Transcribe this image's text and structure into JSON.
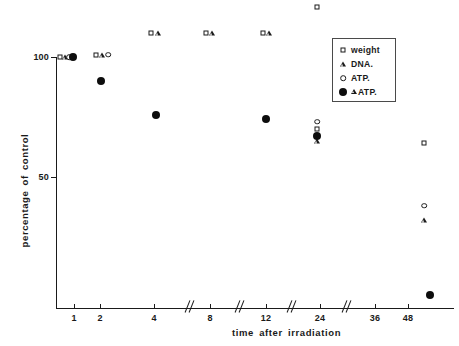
{
  "chart_data": {
    "type": "scatter",
    "title": "",
    "xlabel": "time  after  irradiation",
    "ylabel": "percentage of control",
    "xtick_labels": [
      "1",
      "2",
      "4",
      "8",
      "12",
      "24",
      "36",
      "48"
    ],
    "xtick_px": [
      74,
      100,
      154,
      210,
      266,
      320,
      375,
      408
    ],
    "axis_breaks_px": [
      190,
      240,
      292,
      347
    ],
    "ytick_labels": [
      "100",
      "50"
    ],
    "ytick_values": [
      100,
      50
    ],
    "ylim": [
      0,
      125
    ],
    "grid": false,
    "legend_position": "top-right",
    "series": [
      {
        "name": "weight",
        "marker": "square-open",
        "points": [
          {
            "x_label": "1",
            "x_px": 60,
            "y": 100
          },
          {
            "x_label": "2",
            "x_px": 96,
            "y": 101
          },
          {
            "x_label": "4",
            "x_px": 151,
            "y": 110
          },
          {
            "x_label": "8",
            "x_px": 206,
            "y": 110
          },
          {
            "x_label": "12",
            "x_px": 263,
            "y": 110
          },
          {
            "x_label": "24",
            "x_px": 317,
            "y": 121
          },
          {
            "x_label": "24",
            "x_px": 317,
            "y": 70
          },
          {
            "x_label": "48",
            "x_px": 424,
            "y": 64
          }
        ]
      },
      {
        "name": "DNA.",
        "marker": "triangle-open",
        "points": [
          {
            "x_label": "1",
            "x_px": 65,
            "y": 100
          },
          {
            "x_label": "2",
            "x_px": 102,
            "y": 101
          },
          {
            "x_label": "4",
            "x_px": 158,
            "y": 110
          },
          {
            "x_label": "8",
            "x_px": 212,
            "y": 110
          },
          {
            "x_label": "12",
            "x_px": 269,
            "y": 110
          },
          {
            "x_label": "24",
            "x_px": 317,
            "y": 65
          },
          {
            "x_label": "48",
            "x_px": 424,
            "y": 32
          }
        ]
      },
      {
        "name": "ATP.",
        "marker": "circle-open",
        "points": [
          {
            "x_label": "1",
            "x_px": 69,
            "y": 100
          },
          {
            "x_label": "2",
            "x_px": 108,
            "y": 101
          },
          {
            "x_label": "24",
            "x_px": 317,
            "y": 73
          },
          {
            "x_label": "48",
            "x_px": 424,
            "y": 38
          }
        ]
      },
      {
        "name": "△ATP.",
        "marker": "circle-filled",
        "points": [
          {
            "x_label": "1",
            "x_px": 73,
            "y": 100
          },
          {
            "x_label": "2",
            "x_px": 101,
            "y": 90
          },
          {
            "x_label": "4",
            "x_px": 156,
            "y": 76
          },
          {
            "x_label": "12",
            "x_px": 266,
            "y": 74
          },
          {
            "x_label": "24",
            "x_px": 317,
            "y": 67
          },
          {
            "x_label": "48",
            "x_px": 430,
            "y": 1
          }
        ]
      }
    ]
  },
  "legend": {
    "items": [
      {
        "label": "weight",
        "marker": "square-open",
        "prefix_triangle": false
      },
      {
        "label": "DNA.",
        "marker": "triangle-open",
        "prefix_triangle": false
      },
      {
        "label": "ATP.",
        "marker": "circle-open",
        "prefix_triangle": false
      },
      {
        "label": "ATP.",
        "marker": "circle-filled",
        "prefix_triangle": true
      }
    ]
  },
  "colors": {
    "ink": "#1a1a1a",
    "background": "#ffffff",
    "legend_border": "#4a4a4a"
  }
}
